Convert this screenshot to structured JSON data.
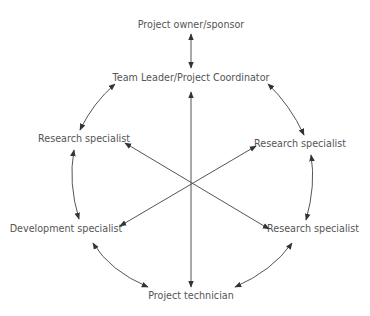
{
  "diagram": {
    "type": "team structure / communication network",
    "line_color": "#555555",
    "text_color": "#555555",
    "nodes": {
      "owner": {
        "label": "Project owner/sponsor"
      },
      "leader": {
        "label": "Team Leader/Project Coordinator"
      },
      "research_upper_left": {
        "label": "Research specialist"
      },
      "research_upper_right": {
        "label": "Research specialist"
      },
      "development": {
        "label": "Development specialist"
      },
      "research_lower_right": {
        "label": "Research specialist"
      },
      "technician": {
        "label": "Project technician"
      }
    },
    "connections": [
      {
        "from": "owner",
        "to": "leader",
        "style": "straight",
        "bidirectional": true
      },
      {
        "from": "leader",
        "to": "research_upper_left",
        "style": "arc",
        "bidirectional": true
      },
      {
        "from": "leader",
        "to": "research_upper_right",
        "style": "arc",
        "bidirectional": true
      },
      {
        "from": "research_upper_left",
        "to": "development",
        "style": "arc",
        "bidirectional": true
      },
      {
        "from": "research_upper_right",
        "to": "research_lower_right",
        "style": "arc",
        "bidirectional": true
      },
      {
        "from": "development",
        "to": "technician",
        "style": "arc",
        "bidirectional": true
      },
      {
        "from": "research_lower_right",
        "to": "technician",
        "style": "arc",
        "bidirectional": true
      },
      {
        "from": "leader",
        "to": "technician",
        "style": "spoke-through-center",
        "bidirectional": true
      },
      {
        "from": "research_upper_left",
        "to": "research_lower_right",
        "style": "spoke-through-center",
        "bidirectional": true
      },
      {
        "from": "research_upper_right",
        "to": "development",
        "style": "spoke-through-center",
        "bidirectional": true
      }
    ]
  }
}
